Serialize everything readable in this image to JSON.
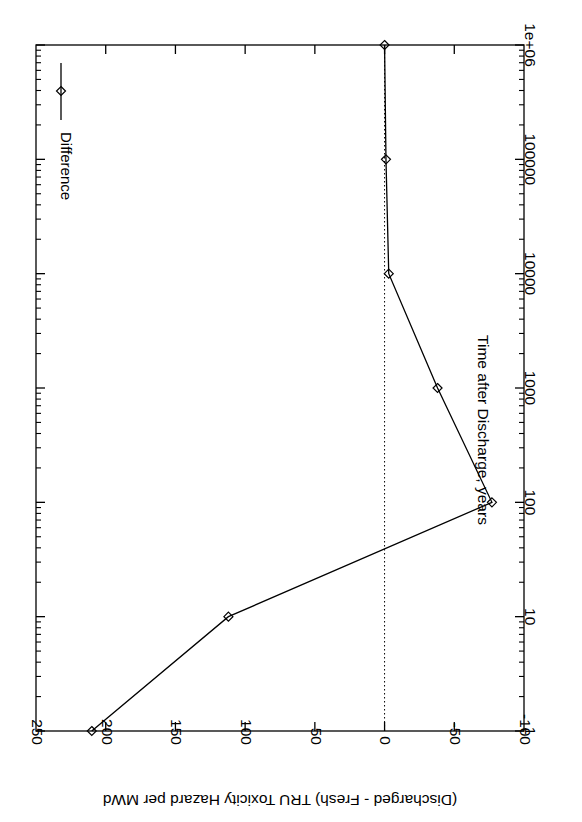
{
  "chart_data": {
    "type": "line",
    "title": "",
    "xlabel": "Time after Discharge, years",
    "ylabel": "(Discharged - Fresh) TRU Toxicity Hazard per MWd",
    "xscale": "log",
    "yscale": "linear",
    "xlim": [
      1,
      1000000
    ],
    "ylim": [
      -100,
      250
    ],
    "xticks": [
      "1",
      "10",
      "100",
      "1000",
      "10000",
      "100000",
      "1e+06"
    ],
    "xtick_values": [
      1,
      10,
      100,
      1000,
      10000,
      100000,
      1000000
    ],
    "yticks": [
      "250",
      "200",
      "150",
      "100",
      "50",
      "0",
      "-50",
      "-100"
    ],
    "ytick_values": [
      250,
      200,
      150,
      100,
      50,
      0,
      -50,
      -100
    ],
    "grid": false,
    "zero_line": 0,
    "legend_position": "top-left-inside",
    "rotation_degrees": 90,
    "series": [
      {
        "name": "Difference",
        "marker": "diamond",
        "color": "#000000",
        "x": [
          1,
          10,
          100,
          1000,
          10000,
          100000,
          1000000
        ],
        "values": [
          210,
          112,
          -77,
          -38,
          -3,
          -1,
          0
        ]
      }
    ]
  },
  "legend": {
    "entries": [
      {
        "label": "Difference",
        "marker": "diamond"
      }
    ]
  },
  "axes": {
    "x_axis_title": "Time after Discharge, years",
    "y_axis_title": "(Discharged - Fresh) TRU Toxicity Hazard per MWd"
  },
  "colors": {
    "line": "#000000",
    "axis": "#000000",
    "background": "#ffffff",
    "zero_line": "#000000"
  }
}
